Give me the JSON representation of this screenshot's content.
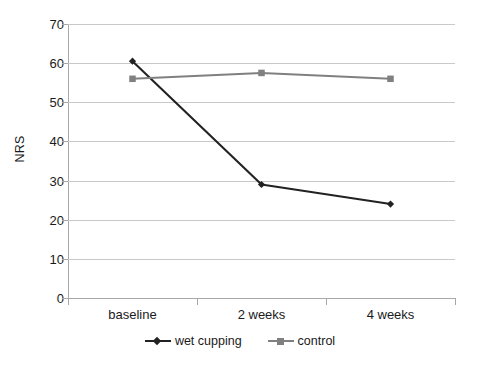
{
  "chart_data": {
    "type": "line",
    "title": "",
    "xlabel": "",
    "ylabel": "NRS",
    "categories": [
      "baseline",
      "2 weeks",
      "4 weeks"
    ],
    "series": [
      {
        "name": "wet cupping",
        "values": [
          60.5,
          29,
          24
        ],
        "color": "#222222",
        "marker": "diamond"
      },
      {
        "name": "control",
        "values": [
          56,
          57.5,
          56
        ],
        "color": "#808080",
        "marker": "square"
      }
    ],
    "ylim": [
      0,
      70
    ],
    "ytick_values": [
      0,
      10,
      20,
      30,
      40,
      50,
      60,
      70
    ],
    "ytick_labels": [
      "0",
      "10",
      "20",
      "30",
      "40",
      "50",
      "60",
      "70"
    ],
    "grid": true,
    "grid_axis": "y",
    "legend_position": "bottom",
    "background": "#ffffff",
    "gridline_color": "#c9c9c9",
    "axis_color": "#a8a8a8"
  }
}
